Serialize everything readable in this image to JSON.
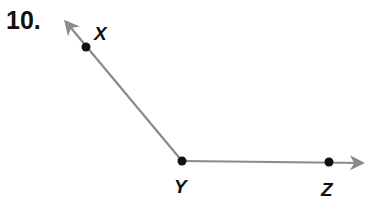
{
  "problem_number": "10.",
  "diagram": {
    "type": "angle",
    "vertex": "Y",
    "rays": [
      {
        "from": "Y",
        "through": "X",
        "direction": "up-left"
      },
      {
        "from": "Y",
        "through": "Z",
        "direction": "right"
      }
    ],
    "points": [
      {
        "name": "X",
        "label": "X"
      },
      {
        "name": "Y",
        "label": "Y"
      },
      {
        "name": "Z",
        "label": "Z"
      }
    ],
    "ray_color": "#8a8a8a",
    "point_color": "#111111"
  }
}
